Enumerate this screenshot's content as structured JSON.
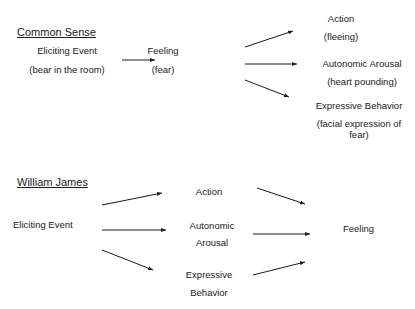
{
  "sections": [
    {
      "heading": "Common Sense",
      "nodes": {
        "eliciting_event": {
          "label": "Eliciting Event",
          "detail": "(bear in the room)"
        },
        "feeling": {
          "label": "Feeling",
          "detail": "(fear)"
        },
        "action": {
          "label": "Action",
          "detail": "(fleeing)"
        },
        "autonomic_arousal": {
          "label": "Autonomic Arousal",
          "detail": "(heart pounding)"
        },
        "expressive_behavior": {
          "label": "Expressive Behavior",
          "detail_line1": "(facial expression of",
          "detail_line2": "fear)"
        }
      },
      "edges": [
        {
          "from": "Eliciting Event",
          "to": "Feeling"
        },
        {
          "from": "Feeling",
          "to": "Action"
        },
        {
          "from": "Feeling",
          "to": "Autonomic Arousal"
        },
        {
          "from": "Feeling",
          "to": "Expressive Behavior"
        }
      ]
    },
    {
      "heading": "William James",
      "nodes": {
        "eliciting_event": {
          "label": "Eliciting Event"
        },
        "action": {
          "label": "Action"
        },
        "autonomic_arousal": {
          "line1": "Autonomic",
          "line2": "Arousal"
        },
        "expressive_behavior": {
          "line1": "Expressive",
          "line2": "Behavior"
        },
        "feeling": {
          "label": "Feeling"
        }
      },
      "edges": [
        {
          "from": "Eliciting Event",
          "to": "Action"
        },
        {
          "from": "Eliciting Event",
          "to": "Autonomic Arousal"
        },
        {
          "from": "Eliciting Event",
          "to": "Expressive Behavior"
        },
        {
          "from": "Action",
          "to": "Feeling"
        },
        {
          "from": "Autonomic Arousal",
          "to": "Feeling"
        },
        {
          "from": "Expressive Behavior",
          "to": "Feeling"
        }
      ]
    }
  ],
  "colors": {
    "text": "#1a1a1a",
    "background": "#ffffff"
  }
}
